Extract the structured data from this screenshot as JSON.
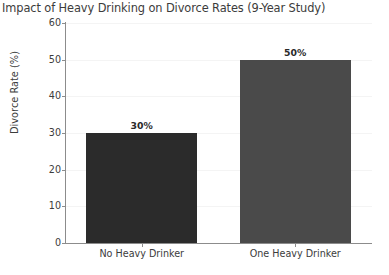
{
  "chart_data": {
    "type": "bar",
    "title": "Impact of Heavy Drinking on Divorce Rates (9-Year Study)",
    "categories": [
      "No Heavy Drinker",
      "One Heavy Drinker"
    ],
    "values": [
      30,
      50
    ],
    "value_labels": [
      "30%",
      "50%"
    ],
    "xlabel": "",
    "ylabel": "Divorce Rate (%)",
    "ylim": [
      0,
      60
    ],
    "ytick_labels": [
      "0",
      "10",
      "20",
      "30",
      "40",
      "50",
      "60"
    ],
    "ytick_values": [
      0,
      10,
      20,
      30,
      40,
      50,
      60
    ],
    "grid": true,
    "grid_axis": "y",
    "legend": false,
    "bar_colors": [
      "#2b2b2b",
      "#4a4a4a"
    ],
    "axis_color": "#8c8c8c",
    "grid_color": "#f4f4f4",
    "text_color": "#3c3c3c",
    "background": "#ffffff"
  }
}
